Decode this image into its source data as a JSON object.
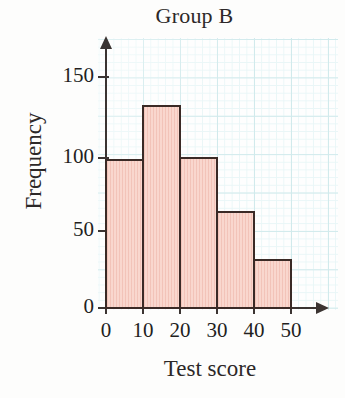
{
  "chart_data": {
    "type": "bar",
    "title": "Group B",
    "xlabel": "Test score",
    "ylabel": "Frequency",
    "categories": [
      "0-10",
      "10-20",
      "20-30",
      "30-40",
      "40-50"
    ],
    "bin_edges": [
      0,
      10,
      20,
      30,
      40,
      50
    ],
    "values": [
      97,
      132,
      98,
      63,
      32
    ],
    "x_tick_labels": [
      "0",
      "10",
      "20",
      "30",
      "40",
      "50"
    ],
    "y_tick_labels": [
      "0",
      "50",
      "100",
      "150"
    ],
    "y_ticks": [
      0,
      50,
      100,
      150
    ],
    "xlim": [
      0,
      50
    ],
    "ylim": [
      0,
      170
    ],
    "grid": true,
    "legend": "none",
    "bar_fill_color": "#f9d7ce",
    "bar_edge_color": "#3a2a26",
    "grid_color": "#cfeaec",
    "axis_color": "#3b3432"
  },
  "icons": {
    "y_axis_arrow": "arrow-up-icon",
    "x_axis_arrow": "arrow-right-icon"
  }
}
